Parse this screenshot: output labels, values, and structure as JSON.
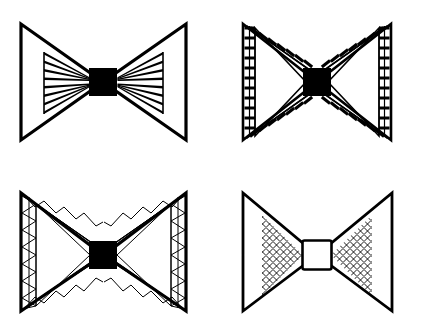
{
  "canvas": {
    "width": 428,
    "height": 320,
    "background": "#ffffff",
    "ink": "#000000",
    "title": "Bowtie truss structure variants"
  },
  "layout": {
    "rows": 2,
    "columns": 2,
    "panel_count": 4
  },
  "figures": [
    {
      "id": "figure-a",
      "name": "radial-spoke-bowtie",
      "position": "top-left",
      "center": {
        "x": 103,
        "y": 82
      },
      "hub": {
        "shape": "square",
        "size": 27,
        "fill": "#000000",
        "stroke": "#000000"
      },
      "outline": {
        "left_wing": [
          [
            21,
            24
          ],
          [
            21,
            140
          ],
          [
            103,
            82
          ]
        ],
        "right_wing": [
          [
            186,
            24
          ],
          [
            186,
            140
          ],
          [
            103,
            82
          ]
        ]
      },
      "outer_stroke": 3.2,
      "web": {
        "type": "radial-spokes",
        "spoke_count": 8,
        "taper": true,
        "chord_x_left": 44,
        "chord_x_right": 163,
        "chord_top": 52,
        "chord_bottom": 112,
        "stroke": 1.0
      }
    },
    {
      "id": "figure-b",
      "name": "ladder-band-bowtie",
      "position": "top-right",
      "center": {
        "x": 317,
        "y": 82
      },
      "hub": {
        "shape": "square",
        "size": 27,
        "fill": "#000000",
        "stroke": "#000000"
      },
      "outline": {
        "left_wing": [
          [
            243,
            24
          ],
          [
            243,
            140
          ],
          [
            317,
            82
          ]
        ],
        "right_wing": [
          [
            392,
            24
          ],
          [
            392,
            140
          ],
          [
            317,
            82
          ]
        ]
      },
      "inner_offset": 12,
      "outer_stroke": 2.6,
      "inner_stroke": 1.6,
      "web": {
        "type": "ladder-band",
        "rung_count_vertical": 11,
        "rung_count_diagonal": 9,
        "rung_stroke": 3.0,
        "rail_stroke": 1.1
      }
    },
    {
      "id": "figure-c",
      "name": "zigzag-truss-bowtie",
      "position": "bottom-left",
      "center": {
        "x": 103,
        "y": 255
      },
      "hub": {
        "shape": "square",
        "size": 27,
        "fill": "#000000",
        "stroke": "#000000"
      },
      "outline": {
        "left_wing": [
          [
            21,
            193
          ],
          [
            21,
            311
          ],
          [
            103,
            255
          ]
        ],
        "right_wing": [
          [
            186,
            193
          ],
          [
            186,
            311
          ],
          [
            103,
            255
          ]
        ]
      },
      "inner_offset": 14,
      "outer_stroke": 3.2,
      "inner_stroke": 1.0,
      "web": {
        "type": "zigzag-truss",
        "bay_count_vertical": 7,
        "bay_count_diagonal": 6,
        "stroke": 1.0
      }
    },
    {
      "id": "figure-d",
      "name": "mesh-infill-bowtie",
      "position": "bottom-right",
      "center": {
        "x": 317,
        "y": 255
      },
      "hub": {
        "shape": "square",
        "size": 29,
        "fill": "#ffffff",
        "stroke": "#000000"
      },
      "outline": {
        "left_wing": [
          [
            243,
            193
          ],
          [
            243,
            311
          ],
          [
            317,
            255
          ]
        ],
        "right_wing": [
          [
            392,
            193
          ],
          [
            392,
            311
          ],
          [
            317,
            255
          ]
        ]
      },
      "outer_stroke": 2.8,
      "web": {
        "type": "diagonal-mesh",
        "mesh_pitch": 7,
        "mesh_angle_deg": 45,
        "stroke": 0.9,
        "inset_triangle_left": [
          [
            262,
            215
          ],
          [
            262,
            296
          ],
          [
            303,
            255
          ]
        ],
        "inset_triangle_right": [
          [
            372,
            215
          ],
          [
            372,
            296
          ],
          [
            331,
            255
          ]
        ]
      }
    }
  ]
}
